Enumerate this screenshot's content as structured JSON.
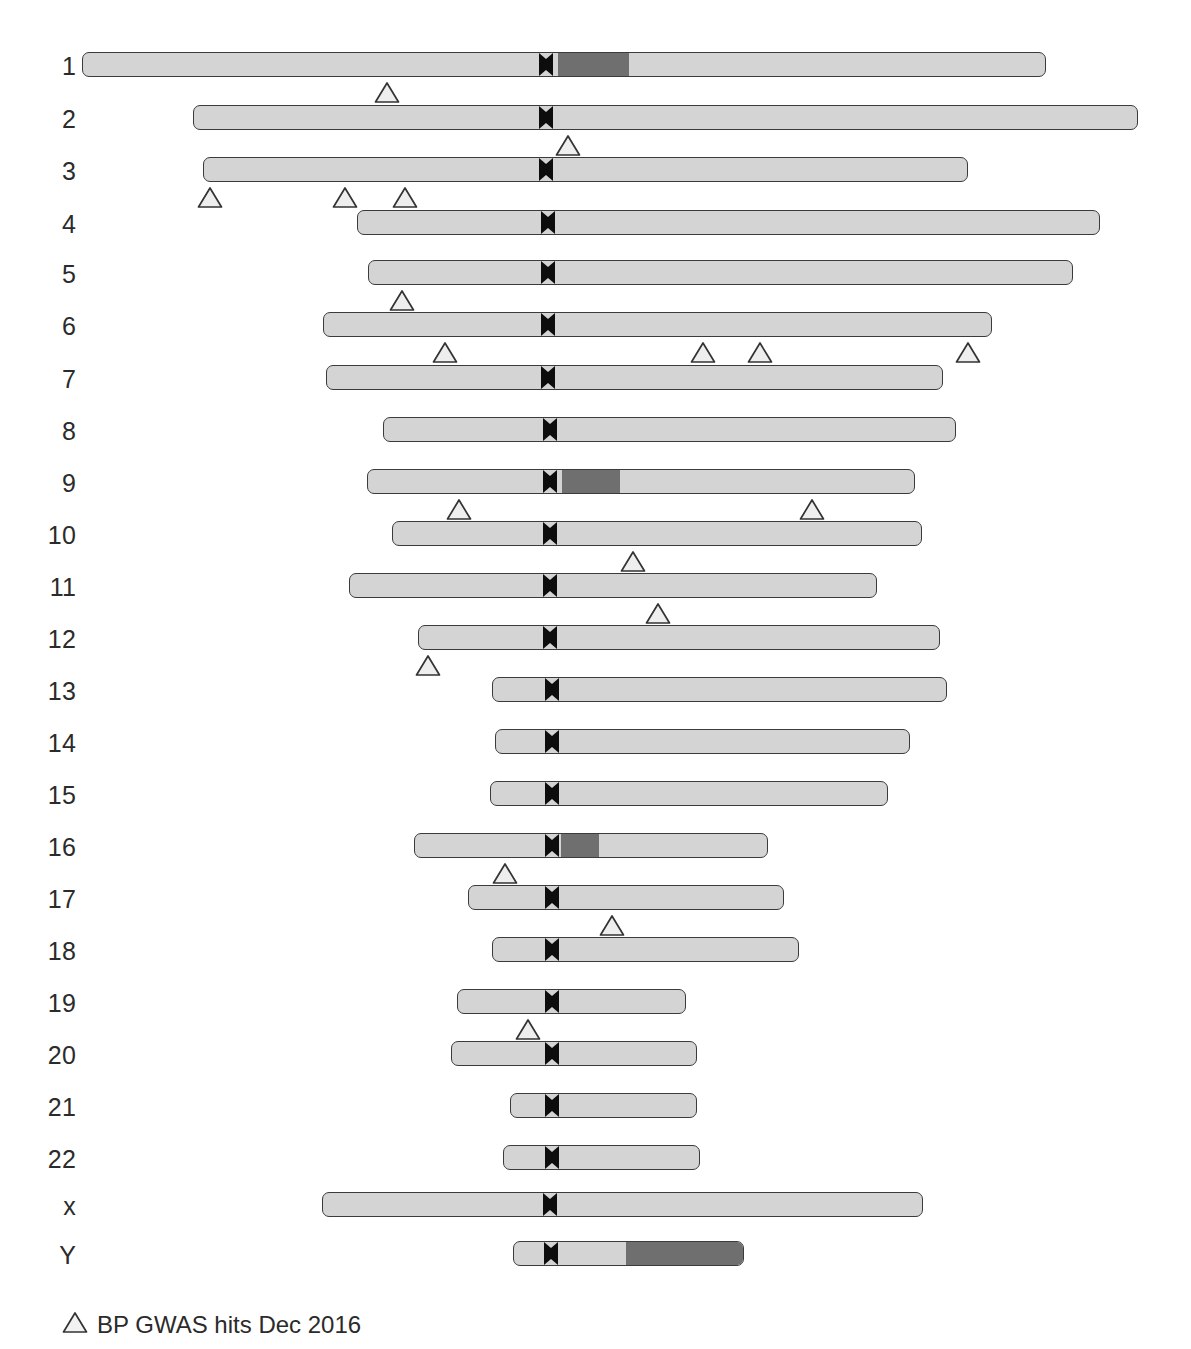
{
  "figure": {
    "width": 1191,
    "height": 1349,
    "background_color": "#ffffff"
  },
  "colors": {
    "chromatin_light": "#d4d4d4",
    "chromatin_dark": "#6f6f6f",
    "centromere": "#0d0d0d",
    "outline": "#3b3b3b",
    "marker_fill": "#eeeeee",
    "marker_stroke": "#333333",
    "text": "#2b2b2b"
  },
  "legend": {
    "marker_icon": "triangle-up-icon",
    "label": "BP GWAS hits Dec 2016",
    "x": 62,
    "y": 1311
  },
  "chart_data": {
    "type": "table",
    "subtitle": "",
    "xlabel": "",
    "ylabel": "Chromosome",
    "grid": false,
    "legend_position": "bottom-left",
    "legend_entries": [
      "BP GWAS hits Dec 2016"
    ],
    "categories": [
      "1",
      "2",
      "3",
      "4",
      "5",
      "6",
      "7",
      "8",
      "9",
      "10",
      "11",
      "12",
      "13",
      "14",
      "15",
      "16",
      "17",
      "18",
      "19",
      "20",
      "21",
      "22",
      "x",
      "Y"
    ],
    "values": [
      1,
      1,
      3,
      0,
      1,
      4,
      0,
      0,
      2,
      1,
      1,
      1,
      0,
      0,
      0,
      1,
      1,
      0,
      1,
      0,
      0,
      0,
      0,
      0
    ],
    "total_hits": 18,
    "note": "values = number of BP GWAS hit markers plotted under each chromosome"
  },
  "chromosomes": [
    {
      "label": "1",
      "row_top": 52,
      "label_x": 40,
      "label_w": 36,
      "label_y": 56,
      "start": 82,
      "end": 1046,
      "centromere": 546,
      "dark_bands": [
        {
          "from": 557,
          "to": 628
        }
      ],
      "hits": [
        {
          "x": 387
        }
      ]
    },
    {
      "label": "2",
      "row_top": 105,
      "label_x": 40,
      "label_w": 36,
      "label_y": 109,
      "start": 193,
      "end": 1138,
      "centromere": 546,
      "dark_bands": [],
      "hits": [
        {
          "x": 568
        }
      ]
    },
    {
      "label": "3",
      "row_top": 157,
      "label_x": 40,
      "label_w": 36,
      "label_y": 161,
      "start": 203,
      "end": 968,
      "centromere": 546,
      "dark_bands": [],
      "hits": [
        {
          "x": 210
        },
        {
          "x": 345
        },
        {
          "x": 405
        }
      ]
    },
    {
      "label": "4",
      "row_top": 210,
      "label_x": 40,
      "label_w": 36,
      "label_y": 214,
      "start": 357,
      "end": 1100,
      "centromere": 548,
      "dark_bands": [],
      "hits": []
    },
    {
      "label": "5",
      "row_top": 260,
      "label_x": 40,
      "label_w": 36,
      "label_y": 264,
      "start": 368,
      "end": 1073,
      "centromere": 548,
      "dark_bands": [],
      "hits": [
        {
          "x": 402
        }
      ]
    },
    {
      "label": "6",
      "row_top": 312,
      "label_x": 40,
      "label_w": 36,
      "label_y": 316,
      "start": 323,
      "end": 992,
      "centromere": 548,
      "dark_bands": [],
      "hits": [
        {
          "x": 445
        },
        {
          "x": 703
        },
        {
          "x": 760
        },
        {
          "x": 968
        }
      ]
    },
    {
      "label": "7",
      "row_top": 365,
      "label_x": 40,
      "label_w": 36,
      "label_y": 369,
      "start": 326,
      "end": 943,
      "centromere": 548,
      "dark_bands": [],
      "hits": []
    },
    {
      "label": "8",
      "row_top": 417,
      "label_x": 40,
      "label_w": 36,
      "label_y": 421,
      "start": 383,
      "end": 956,
      "centromere": 550,
      "dark_bands": [],
      "hits": []
    },
    {
      "label": "9",
      "row_top": 469,
      "label_x": 40,
      "label_w": 36,
      "label_y": 473,
      "start": 367,
      "end": 915,
      "centromere": 550,
      "dark_bands": [
        {
          "from": 561,
          "to": 619
        }
      ],
      "hits": [
        {
          "x": 459
        },
        {
          "x": 812
        }
      ]
    },
    {
      "label": "10",
      "row_top": 521,
      "label_x": 30,
      "label_w": 46,
      "label_y": 525,
      "start": 392,
      "end": 922,
      "centromere": 550,
      "dark_bands": [],
      "hits": [
        {
          "x": 633
        }
      ]
    },
    {
      "label": "11",
      "row_top": 573,
      "label_x": 30,
      "label_w": 46,
      "label_y": 577,
      "start": 349,
      "end": 877,
      "centromere": 550,
      "dark_bands": [],
      "hits": [
        {
          "x": 658
        }
      ]
    },
    {
      "label": "12",
      "row_top": 625,
      "label_x": 30,
      "label_w": 46,
      "label_y": 629,
      "start": 418,
      "end": 940,
      "centromere": 550,
      "dark_bands": [],
      "hits": [
        {
          "x": 428
        }
      ]
    },
    {
      "label": "13",
      "row_top": 677,
      "label_x": 30,
      "label_w": 46,
      "label_y": 681,
      "start": 492,
      "end": 947,
      "centromere": 552,
      "dark_bands": [],
      "hits": []
    },
    {
      "label": "14",
      "row_top": 729,
      "label_x": 30,
      "label_w": 46,
      "label_y": 733,
      "start": 495,
      "end": 910,
      "centromere": 552,
      "dark_bands": [],
      "hits": []
    },
    {
      "label": "15",
      "row_top": 781,
      "label_x": 30,
      "label_w": 46,
      "label_y": 785,
      "start": 490,
      "end": 888,
      "centromere": 552,
      "dark_bands": [],
      "hits": []
    },
    {
      "label": "16",
      "row_top": 833,
      "label_x": 30,
      "label_w": 46,
      "label_y": 837,
      "start": 414,
      "end": 768,
      "centromere": 552,
      "dark_bands": [
        {
          "from": 560,
          "to": 598
        }
      ],
      "hits": [
        {
          "x": 505
        }
      ]
    },
    {
      "label": "17",
      "row_top": 885,
      "label_x": 30,
      "label_w": 46,
      "label_y": 889,
      "start": 468,
      "end": 784,
      "centromere": 552,
      "dark_bands": [],
      "hits": [
        {
          "x": 612
        }
      ]
    },
    {
      "label": "18",
      "row_top": 937,
      "label_x": 30,
      "label_w": 46,
      "label_y": 941,
      "start": 492,
      "end": 799,
      "centromere": 552,
      "dark_bands": [],
      "hits": []
    },
    {
      "label": "19",
      "row_top": 989,
      "label_x": 30,
      "label_w": 46,
      "label_y": 993,
      "start": 457,
      "end": 686,
      "centromere": 552,
      "dark_bands": [],
      "hits": [
        {
          "x": 528
        }
      ]
    },
    {
      "label": "20",
      "row_top": 1041,
      "label_x": 30,
      "label_w": 46,
      "label_y": 1045,
      "start": 451,
      "end": 697,
      "centromere": 552,
      "dark_bands": [],
      "hits": []
    },
    {
      "label": "21",
      "row_top": 1093,
      "label_x": 30,
      "label_w": 46,
      "label_y": 1097,
      "start": 510,
      "end": 697,
      "centromere": 552,
      "dark_bands": [],
      "hits": []
    },
    {
      "label": "22",
      "row_top": 1145,
      "label_x": 30,
      "label_w": 46,
      "label_y": 1149,
      "start": 503,
      "end": 700,
      "centromere": 552,
      "dark_bands": [],
      "hits": []
    },
    {
      "label": "x",
      "row_top": 1192,
      "label_x": 30,
      "label_w": 46,
      "label_y": 1196,
      "start": 322,
      "end": 923,
      "centromere": 550,
      "dark_bands": [],
      "hits": []
    },
    {
      "label": "Y",
      "row_top": 1241,
      "label_x": 30,
      "label_w": 46,
      "label_y": 1245,
      "start": 513,
      "end": 744,
      "centromere": 551,
      "dark_bands": [
        {
          "from": 625,
          "to": 744
        }
      ],
      "hits": []
    }
  ]
}
